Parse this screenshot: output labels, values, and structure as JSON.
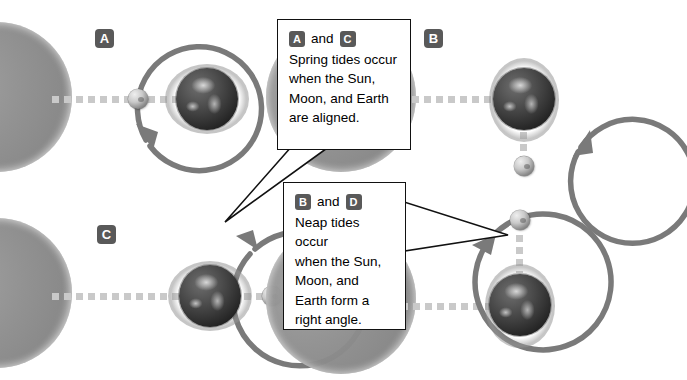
{
  "figure": {
    "background_color": "#ffffff",
    "badge_color": "#595959",
    "orbit_color": "#7a7a7a",
    "dotted_line_color": "#c9c9c9",
    "callout_border_color": "#111111"
  },
  "panels": [
    {
      "id": "a",
      "label": "A",
      "tide_type": "Spring tide",
      "moon_position": "between Sun and Earth (left of Earth, aligned)",
      "alignment": "Sun, Moon, and Earth aligned",
      "orbit_arrow_direction": "clockwise, arrowhead at lower-left",
      "bulge_axis": "horizontal"
    },
    {
      "id": "b",
      "label": "B",
      "tide_type": "Neap tide",
      "moon_position": "below Earth (90 degrees from Sun line)",
      "alignment": "Sun, Moon, and Earth form a right angle",
      "orbit_arrow_direction": "counter-clockwise, arrowhead at lower-right",
      "bulge_axis": "vertical"
    },
    {
      "id": "c",
      "label": "C",
      "tide_type": "Spring tide",
      "moon_position": "right of Earth, opposite the Sun (aligned)",
      "alignment": "Sun, Moon, and Earth aligned",
      "orbit_arrow_direction": "counter-clockwise, arrowhead at upper-right",
      "bulge_axis": "horizontal"
    },
    {
      "id": "d",
      "label": "D",
      "tide_type": "Neap tide",
      "moon_position": "above Earth (90 degrees from Sun line)",
      "alignment": "Sun, Moon, and Earth form a right angle",
      "orbit_arrow_direction": "counter-clockwise, arrowhead at upper-left",
      "bulge_axis": "vertical"
    }
  ],
  "callouts": [
    {
      "id": "spring",
      "badge_first": "A",
      "conjunction": "and",
      "badge_second": "C",
      "text": "Spring tides occur\nwhen the Sun,\nMoon, and Earth\nare aligned.",
      "points_to": "panel C orbit, lower-left"
    },
    {
      "id": "neap",
      "badge_first": "B",
      "conjunction": "and",
      "badge_second": "D",
      "text": "Neap tides occur\nwhen the Sun,\nMoon, and\nEarth form a\nright angle.",
      "points_to": "panel D, to the right"
    }
  ],
  "icons": {
    "sun": "sun-half-disc-icon",
    "earth": "earth-globe-icon",
    "moon": "moon-sphere-icon",
    "orbit": "orbit-arrow-icon",
    "dotted": "alignment-dotted-line-icon"
  }
}
